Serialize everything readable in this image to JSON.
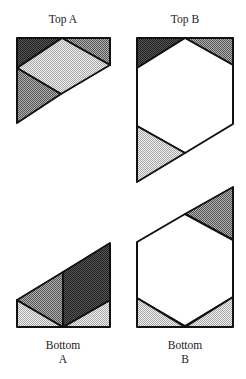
{
  "labels": {
    "top_a": "Top A",
    "top_b": "Top B",
    "bottom_a_line1": "Bottom",
    "bottom_a_line2": "A",
    "bottom_b_line1": "Bottom",
    "bottom_b_line2": "B"
  },
  "colors": {
    "dark": "#3c3c3c",
    "medium": "#8a8a8a",
    "light": "#cfcfcf",
    "white": "#ffffff",
    "stroke": "#111111"
  }
}
